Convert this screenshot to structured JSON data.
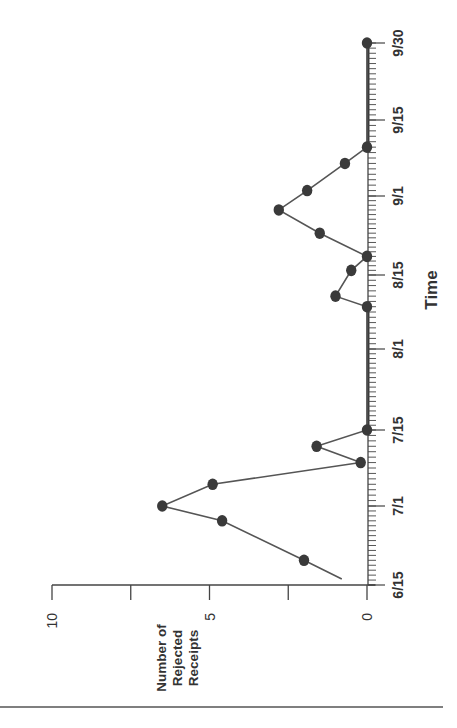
{
  "chart_data": {
    "type": "line",
    "orientation": "rotated-90-ccw",
    "title": "",
    "xlabel": "Time",
    "ylabel": "Number of Rejected Receipts",
    "ylabel_lines": [
      "Number of",
      "Rejected",
      "Receipts"
    ],
    "ylim": [
      0,
      10
    ],
    "y_ticks": [
      0,
      2.5,
      5,
      7.5,
      10
    ],
    "y_tick_labels": [
      "0",
      "",
      "5",
      "",
      "10"
    ],
    "x_tick_labels": [
      "6/15",
      "7/1",
      "7/15",
      "8/1",
      "8/15",
      "9/1",
      "9/15",
      "9/30"
    ],
    "grid": false,
    "legend": null,
    "line_start": {
      "x": "6/16",
      "y": 0.8
    },
    "series": [
      {
        "name": "Rejected Receipts",
        "x": [
          "6/20",
          "6/28",
          "7/1",
          "7/5",
          "7/9",
          "7/12",
          "7/15",
          "8/9",
          "8/11",
          "8/16",
          "8/19",
          "8/24",
          "8/29",
          "9/2",
          "9/7",
          "9/10",
          "9/30"
        ],
        "values": [
          2,
          4.6,
          6.5,
          4.9,
          0.2,
          1.6,
          0,
          0,
          1,
          0.5,
          0,
          1.5,
          2.8,
          1.9,
          0.7,
          0,
          0
        ]
      }
    ],
    "colors": {
      "line": "#555555",
      "marker": "#3a3a3a",
      "axis": "#444444"
    }
  },
  "labels": {
    "time_axis_title": "Time",
    "value_axis_title": [
      "Number of",
      "Rejected",
      "Receipts"
    ]
  }
}
